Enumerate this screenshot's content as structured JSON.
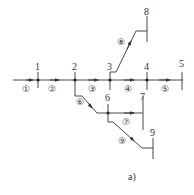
{
  "diagram": {
    "caption": "a)",
    "line_color": "#333333",
    "nodes": [
      {
        "id": "1",
        "label": "1"
      },
      {
        "id": "2",
        "label": "2"
      },
      {
        "id": "3",
        "label": "3"
      },
      {
        "id": "4",
        "label": "4"
      },
      {
        "id": "5",
        "label": "5"
      },
      {
        "id": "6",
        "label": "6"
      },
      {
        "id": "7",
        "label": "7"
      },
      {
        "id": "8",
        "label": "8"
      },
      {
        "id": "9",
        "label": "9"
      }
    ],
    "segments": [
      {
        "id": "s1",
        "label": "①",
        "from": "start",
        "to": "1"
      },
      {
        "id": "s2",
        "label": "②",
        "from": "1",
        "to": "2"
      },
      {
        "id": "s3",
        "label": "③",
        "from": "2",
        "to": "3"
      },
      {
        "id": "s4",
        "label": "④",
        "from": "3",
        "to": "4"
      },
      {
        "id": "s5",
        "label": "⑤",
        "from": "4",
        "to": "5"
      },
      {
        "id": "s6",
        "label": "⑥",
        "from": "2",
        "to": "6"
      },
      {
        "id": "s7",
        "label": "⑦",
        "from": "6",
        "to": "7"
      },
      {
        "id": "s8",
        "label": "⑧",
        "from": "3",
        "to": "8"
      },
      {
        "id": "s9",
        "label": "⑨",
        "from": "6",
        "to": "9"
      }
    ]
  }
}
